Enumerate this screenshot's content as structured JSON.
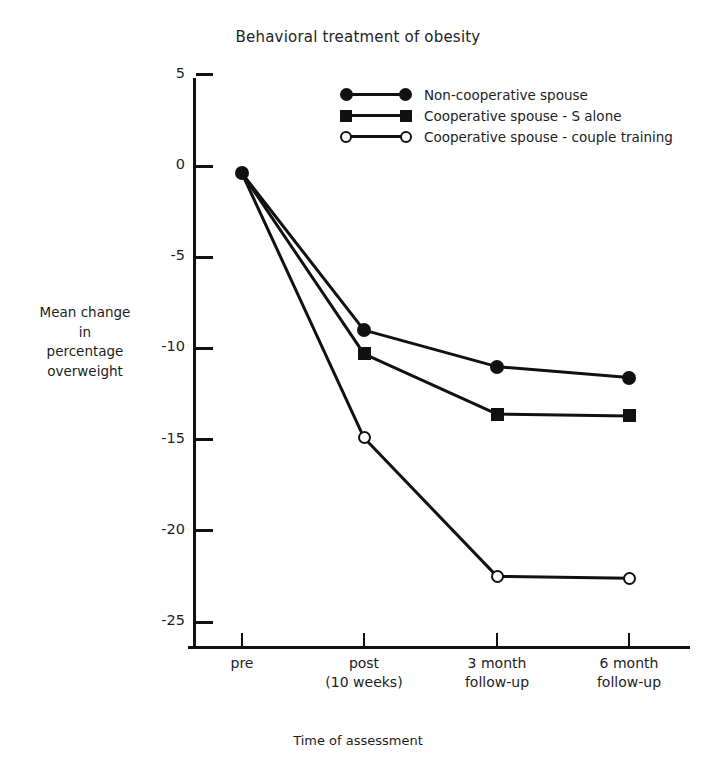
{
  "chart_data": {
    "type": "line",
    "title": "Behavioral treatment of obesity",
    "xlabel": "Time of assessment",
    "ylabel": "Mean change\nin\npercentage\noverweight",
    "ylabel_lines": [
      "Mean change",
      "in",
      "percentage",
      "overweight"
    ],
    "categories": [
      "pre",
      "post\n(10 weeks)",
      "3 month\nfollow-up",
      "6 month\nfollow-up"
    ],
    "category_lines": [
      [
        "pre"
      ],
      [
        "post",
        "(10 weeks)"
      ],
      [
        "3 month",
        "follow-up"
      ],
      [
        "6 month",
        "follow-up"
      ]
    ],
    "ylim": [
      -27,
      6.5
    ],
    "yticks": [
      5,
      0,
      -5,
      -10,
      -15,
      -20,
      -25
    ],
    "ytick_labels": [
      "5",
      "0",
      "-5",
      "-10",
      "-15",
      "-20",
      "-25"
    ],
    "grid": false,
    "legend_position": "upper center inside",
    "series": [
      {
        "name": "Non-cooperative spouse",
        "marker": "filled-circle",
        "values": [
          -0.4,
          -9.0,
          -11.0,
          -11.6
        ]
      },
      {
        "name": "Cooperative spouse - S alone",
        "marker": "filled-square",
        "values": [
          -0.4,
          -10.3,
          -13.6,
          -13.7
        ]
      },
      {
        "name": "Cooperative spouse - couple training",
        "marker": "open-circle",
        "values": [
          -0.4,
          -14.9,
          -22.5,
          -22.6
        ]
      }
    ],
    "colors": {
      "line": "#111111",
      "marker_fill": "#111111",
      "open_marker_fill": "#ffffff",
      "background": "#ffffff"
    }
  }
}
